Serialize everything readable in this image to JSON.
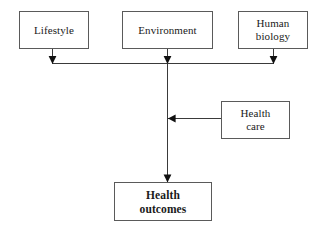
{
  "diagram": {
    "line_color": "#3a3a3a",
    "box_border_color": "#5a5a5a",
    "box_fill_color": "#ffffff",
    "background_color": "#ffffff",
    "nodes": {
      "lifestyle": {
        "label": "Lifestyle"
      },
      "environment": {
        "label": "Environment"
      },
      "human_biology": {
        "label": "Human\nbiology"
      },
      "health_care": {
        "label": "Health\ncare"
      },
      "health_outcomes": {
        "label": "Health\noutcomes"
      }
    },
    "connectors": [
      {
        "name": "lifestyle-to-bus",
        "from": "lifestyle",
        "to": "distribution-bus",
        "arrow": "down"
      },
      {
        "name": "environment-to-bus",
        "from": "environment",
        "to": "distribution-bus",
        "arrow": "down"
      },
      {
        "name": "human-biology-to-bus",
        "from": "human_biology",
        "to": "distribution-bus",
        "arrow": "down"
      },
      {
        "name": "health-care-to-trunk",
        "from": "health_care",
        "to": "vertical-trunk",
        "arrow": "left"
      },
      {
        "name": "trunk-to-health-outcomes",
        "from": "distribution-bus",
        "to": "health_outcomes",
        "arrow": "down"
      }
    ]
  }
}
